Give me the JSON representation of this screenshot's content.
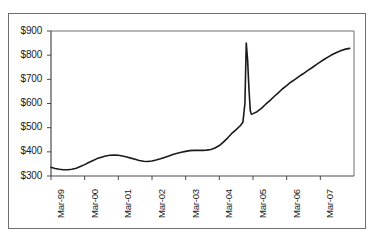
{
  "chart_data": {
    "type": "line",
    "title": "",
    "subtitle": "",
    "xlabel": "",
    "ylabel": "",
    "grid": false,
    "legend": null,
    "legend_position": "none",
    "line_color": "#1a1a1a",
    "frame_color": "#6e6e6e",
    "background": "#ffffff",
    "ylim": [
      300,
      900
    ],
    "ytick_step": 100,
    "ytick_labels": [
      "$300",
      "$400",
      "$500",
      "$600",
      "$700",
      "$800",
      "$900"
    ],
    "ytick_values": [
      300,
      400,
      500,
      600,
      700,
      800,
      900
    ],
    "xtick_labels": [
      "Mar-99",
      "Mar-00",
      "Mar-01",
      "Mar-02",
      "Mar-03",
      "Mar-04",
      "Mar-05",
      "Mar-06",
      "Mar-07"
    ],
    "xtick_values": [
      1999.0,
      2000.0,
      2001.0,
      2002.0,
      2003.0,
      2004.0,
      2005.0,
      2006.0,
      2007.0
    ],
    "xlim": [
      1999.0,
      2008.0
    ],
    "annotations": [
      {
        "label": "spike-peak",
        "x": 2004.8,
        "y": 850
      },
      {
        "label": "post-spike-drop",
        "x": 2004.95,
        "y": 555
      }
    ],
    "series": [
      {
        "name": "value",
        "x": [
          1999.0,
          1999.12,
          1999.25,
          1999.37,
          1999.5,
          1999.62,
          1999.75,
          1999.87,
          2000.0,
          2000.12,
          2000.25,
          2000.37,
          2000.5,
          2000.62,
          2000.75,
          2000.87,
          2001.0,
          2001.12,
          2001.25,
          2001.37,
          2001.5,
          2001.62,
          2001.75,
          2001.87,
          2002.0,
          2002.12,
          2002.25,
          2002.37,
          2002.5,
          2002.62,
          2002.75,
          2002.87,
          2003.0,
          2003.12,
          2003.25,
          2003.37,
          2003.5,
          2003.62,
          2003.75,
          2003.87,
          2004.0,
          2004.12,
          2004.25,
          2004.37,
          2004.5,
          2004.62,
          2004.7,
          2004.76,
          2004.8,
          2004.84,
          2004.88,
          2004.92,
          2004.95,
          2005.0,
          2005.12,
          2005.25,
          2005.37,
          2005.5,
          2005.62,
          2005.75,
          2005.87,
          2006.0,
          2006.12,
          2006.25,
          2006.37,
          2006.5,
          2006.62,
          2006.75,
          2006.87,
          2007.0,
          2007.12,
          2007.25,
          2007.37,
          2007.5,
          2007.62,
          2007.75,
          2007.87
        ],
        "y": [
          336,
          331,
          328,
          326,
          326,
          328,
          332,
          339,
          347,
          356,
          364,
          372,
          378,
          383,
          386,
          387,
          386,
          383,
          379,
          374,
          369,
          364,
          361,
          360,
          362,
          366,
          371,
          377,
          383,
          389,
          394,
          398,
          402,
          405,
          406,
          406,
          406,
          407,
          410,
          416,
          426,
          440,
          458,
          476,
          492,
          508,
          522,
          600,
          850,
          780,
          660,
          570,
          556,
          558,
          566,
          580,
          596,
          612,
          628,
          644,
          660,
          674,
          688,
          700,
          712,
          724,
          736,
          748,
          760,
          772,
          783,
          794,
          804,
          812,
          819,
          825,
          828
        ]
      }
    ]
  },
  "axes": {
    "y_axis_name": "dollar-value-axis",
    "x_axis_name": "date-axis"
  }
}
